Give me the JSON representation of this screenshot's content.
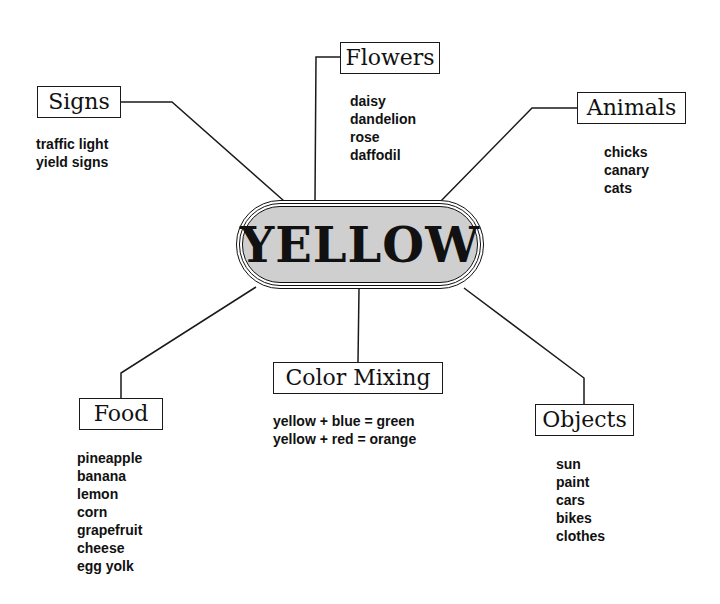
{
  "center": {
    "label": "YELLOW",
    "fill": "#cfcfcf"
  },
  "branches": {
    "signs": {
      "label": "Signs",
      "items": [
        "traffic light",
        "yield signs"
      ]
    },
    "flowers": {
      "label": "Flowers",
      "items": [
        "daisy",
        "dandelion",
        "rose",
        "daffodil"
      ]
    },
    "animals": {
      "label": "Animals",
      "items": [
        "chicks",
        "canary",
        "cats"
      ]
    },
    "food": {
      "label": "Food",
      "items": [
        "pineapple",
        "banana",
        "lemon",
        "corn",
        "grapefruit",
        "cheese",
        "egg yolk"
      ]
    },
    "color_mixing": {
      "label": "Color Mixing",
      "items": [
        "yellow + blue = green",
        "yellow + red = orange"
      ]
    },
    "objects": {
      "label": "Objects",
      "items": [
        "sun",
        "paint",
        "cars",
        "bikes",
        "clothes"
      ]
    }
  }
}
